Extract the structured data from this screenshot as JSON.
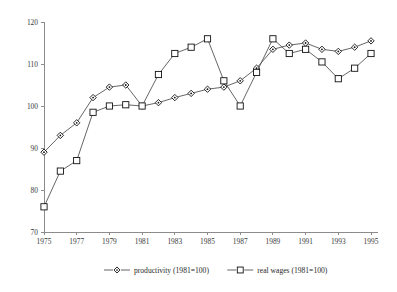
{
  "chart_data": {
    "type": "line",
    "title": "",
    "subtitle": "",
    "xlabel": "",
    "ylabel": "",
    "xlim": [
      1975,
      1995
    ],
    "ylim": [
      70,
      120
    ],
    "xticks": [
      1975,
      1977,
      1979,
      1981,
      1983,
      1985,
      1987,
      1989,
      1991,
      1993,
      1995
    ],
    "xtick_labels": [
      "1975",
      "1977",
      "1979",
      "1981",
      "1983",
      "1985",
      "1987",
      "1989",
      "1991",
      "1993",
      "1995"
    ],
    "yticks": [
      70,
      80,
      90,
      100,
      110,
      120
    ],
    "ytick_labels": [
      "70",
      "80",
      "90",
      "100",
      "110",
      "120"
    ],
    "grid": false,
    "legend_position": "bottom-center",
    "x": [
      1975,
      1976,
      1977,
      1978,
      1979,
      1980,
      1981,
      1982,
      1983,
      1984,
      1985,
      1986,
      1987,
      1988,
      1989,
      1990,
      1991,
      1992,
      1993,
      1994,
      1995
    ],
    "series": [
      {
        "name": "productivity (1981=100)",
        "marker": "diamond",
        "values": [
          89.0,
          93.0,
          96.0,
          102.0,
          104.5,
          105.0,
          100.0,
          100.8,
          102.0,
          103.0,
          104.0,
          104.5,
          106.0,
          109.0,
          113.5,
          114.5,
          115.0,
          113.5,
          113.0,
          114.0,
          115.5
        ]
      },
      {
        "name": "real wages (1981=100)",
        "marker": "square",
        "values": [
          76.0,
          84.5,
          87.0,
          98.5,
          100.0,
          100.3,
          100.0,
          107.5,
          112.5,
          114.0,
          116.0,
          106.0,
          100.0,
          108.0,
          116.0,
          112.5,
          113.5,
          110.5,
          106.5,
          109.0,
          112.5
        ]
      }
    ],
    "legend": [
      {
        "label": "productivity (1981=100)",
        "marker": "diamond"
      },
      {
        "label": "real wages (1981=100)",
        "marker": "square"
      }
    ],
    "colors": {
      "line": "#4a4a4a",
      "marker_stroke": "#111111",
      "marker_fill": "#ffffff",
      "axis": "#8c8c8c",
      "text": "#1f1f1f",
      "background": "#ffffff"
    }
  }
}
